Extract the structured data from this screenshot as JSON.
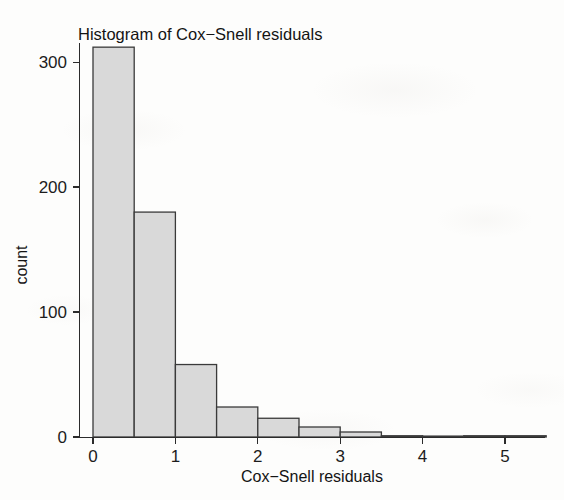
{
  "chart_data": {
    "type": "bar",
    "title": "Histogram of Cox−Snell residuals",
    "xlabel": "Cox−Snell residuals",
    "ylabel": "count",
    "binwidth": 0.5,
    "bin_edges": [
      0,
      0.5,
      1.0,
      1.5,
      2.0,
      2.5,
      3.0,
      3.5,
      4.0,
      4.5,
      5.0,
      5.5
    ],
    "categories": [
      "0–0.5",
      "0.5–1",
      "1–1.5",
      "1.5–2",
      "2–2.5",
      "2.5–3",
      "3–3.5",
      "3.5–4",
      "4–4.5",
      "4.5–5",
      "5–5.5"
    ],
    "values": [
      312,
      180,
      58,
      24,
      15,
      8,
      4,
      1,
      0,
      1,
      1
    ],
    "xlim": [
      -0.28,
      5.62
    ],
    "ylim": [
      0,
      320
    ],
    "xticks": [
      0,
      1,
      2,
      3,
      4,
      5
    ],
    "xtick_labels": [
      "0",
      "1",
      "2",
      "3",
      "4",
      "5"
    ],
    "yticks": [
      0,
      100,
      200,
      300
    ],
    "ytick_labels": [
      "0",
      "100",
      "200",
      "300"
    ],
    "grid": false,
    "legend": false,
    "bar_fill_color": "#d9d9d9",
    "bar_stroke_color": "#3a3a3a",
    "axis_color": "#2b2b2b",
    "background_color": "#fdfdfc"
  }
}
